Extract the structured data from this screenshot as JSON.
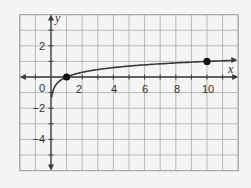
{
  "chart_data": {
    "type": "line",
    "title": "",
    "function": "y = log10(x)",
    "xlabel": "x",
    "ylabel": "y",
    "xlim": [
      -2,
      12
    ],
    "ylim": [
      -6,
      4
    ],
    "grid": true,
    "x_ticks": [
      2,
      4,
      6,
      8,
      10
    ],
    "y_ticks": [
      2,
      -2,
      -4
    ],
    "origin_label": "0",
    "series": [
      {
        "name": "log10(x)",
        "x": [
          0.05,
          0.1,
          0.2,
          0.5,
          1,
          2,
          3,
          4,
          5,
          6,
          7,
          8,
          9,
          10,
          11,
          12
        ],
        "y": [
          -1.3,
          -1,
          -0.7,
          -0.3,
          0,
          0.301,
          0.477,
          0.602,
          0.699,
          0.778,
          0.845,
          0.903,
          0.954,
          1,
          1.041,
          1.079
        ]
      }
    ],
    "points": [
      {
        "x": 1,
        "y": 0
      },
      {
        "x": 10,
        "y": 1
      }
    ]
  },
  "colors": {
    "background": "#f5f5f5",
    "grid": "#a9a9a9",
    "axis": "#3a3a3a",
    "curve": "#3a3a3a",
    "point": "#111111"
  },
  "labels": {
    "x_axis": "x",
    "y_axis": "y",
    "origin": "0",
    "x_tick_2": "2",
    "x_tick_4": "4",
    "x_tick_6": "6",
    "x_tick_8": "8",
    "x_tick_10": "10",
    "y_tick_2": "2",
    "y_tick_m2": "−2",
    "y_tick_m4": "−4"
  }
}
